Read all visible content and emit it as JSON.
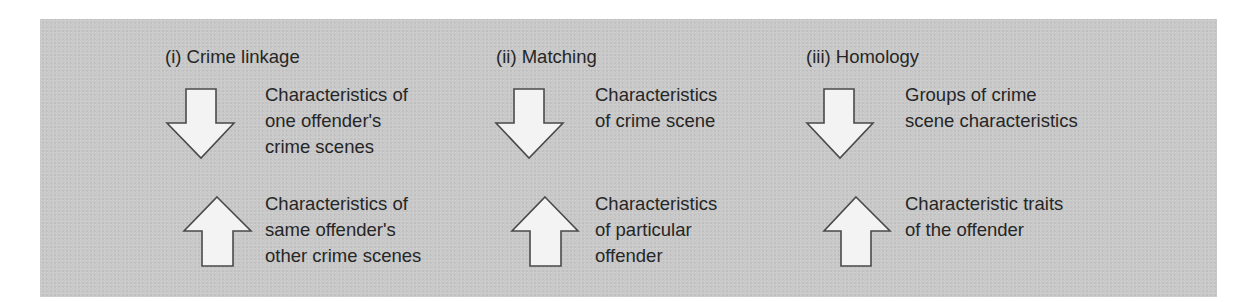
{
  "diagram": {
    "colors": {
      "panel_background": "#c9c9c9",
      "arrow_fill": "#f3f3f3",
      "arrow_stroke": "#4a4a4a",
      "text": "#262626"
    },
    "columns": [
      {
        "title": "(i) Crime linkage",
        "down": {
          "icon": "down-arrow-icon",
          "lines": [
            "Characteristics of",
            "one offender's",
            "crime scenes"
          ]
        },
        "up": {
          "icon": "up-arrow-icon",
          "lines": [
            "Characteristics of",
            "same offender's",
            "other crime scenes"
          ]
        }
      },
      {
        "title": "(ii) Matching",
        "down": {
          "icon": "down-arrow-icon",
          "lines": [
            "Characteristics",
            "of crime scene"
          ]
        },
        "up": {
          "icon": "up-arrow-icon",
          "lines": [
            "Characteristics",
            "of particular",
            "offender"
          ]
        }
      },
      {
        "title": "(iii) Homology",
        "down": {
          "icon": "down-arrow-icon",
          "lines": [
            "Groups of crime",
            "scene characteristics"
          ]
        },
        "up": {
          "icon": "up-arrow-icon",
          "lines": [
            "Characteristic traits",
            "of the offender"
          ]
        }
      }
    ]
  }
}
